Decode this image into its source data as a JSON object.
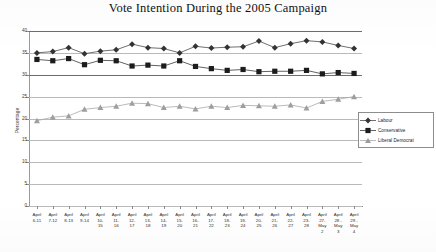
{
  "chart_data": {
    "type": "line",
    "title": "Vote Intention During the 2005 Campaign",
    "xlabel": "",
    "ylabel": "Percentage",
    "ylim": [
      0,
      40
    ],
    "ytick_values": [
      0,
      5,
      10,
      15,
      20,
      25,
      30,
      35,
      40
    ],
    "ytick_labels": [
      "0",
      "5",
      "10",
      "15",
      "20",
      "25",
      "30",
      "35",
      "40"
    ],
    "grid": true,
    "legend_position": "right",
    "categories": [
      "April\n6-11",
      "April\n7-12",
      "April\n8-13",
      "April\n9-14",
      "April\n10-\n15",
      "April\n11-\n16",
      "April\n12-\n17",
      "April\n13-\n18",
      "April\n14-\n19",
      "April\n15-\n20",
      "April\n16-\n21",
      "April\n17-\n22",
      "April\n18-\n23",
      "April\n19-\n24",
      "April\n20-\n25",
      "April\n21-\n26",
      "April\n22-\n27",
      "April\n23-\n28",
      "April\n27-\nMay\n2",
      "April\n28 -\nMay\n3",
      "April\n29 -\nMay\n4"
    ],
    "series": [
      {
        "name": "Labour",
        "marker": "diamond",
        "color": "#333333",
        "values": [
          35.0,
          35.3,
          36.2,
          34.8,
          35.4,
          35.7,
          37.0,
          36.2,
          36.0,
          35.0,
          36.5,
          36.1,
          36.3,
          36.4,
          37.7,
          36.2,
          37.1,
          37.8,
          37.5,
          36.7,
          36.0
        ]
      },
      {
        "name": "Conservative",
        "marker": "square",
        "color": "#1c1c1c",
        "values": [
          33.5,
          33.2,
          33.7,
          32.3,
          33.3,
          33.2,
          32.0,
          32.2,
          32.0,
          33.2,
          31.9,
          31.4,
          31.0,
          31.2,
          30.7,
          30.8,
          30.8,
          31.0,
          30.2,
          30.5,
          30.3
        ]
      },
      {
        "name": "Liberal Democrat",
        "marker": "triangle",
        "color": "#9e9e9e",
        "values": [
          19.5,
          20.3,
          20.6,
          22.1,
          22.5,
          22.8,
          23.5,
          23.4,
          22.5,
          22.8,
          22.2,
          22.8,
          22.5,
          23.0,
          22.9,
          22.8,
          23.1,
          22.4,
          23.9,
          24.4,
          25.0
        ]
      }
    ]
  },
  "legend": {
    "items": [
      {
        "label": "Labour",
        "marker": "diamond"
      },
      {
        "label": "Conservative",
        "marker": "square"
      },
      {
        "label": "Liberal Democrat",
        "marker": "triangle"
      }
    ]
  }
}
